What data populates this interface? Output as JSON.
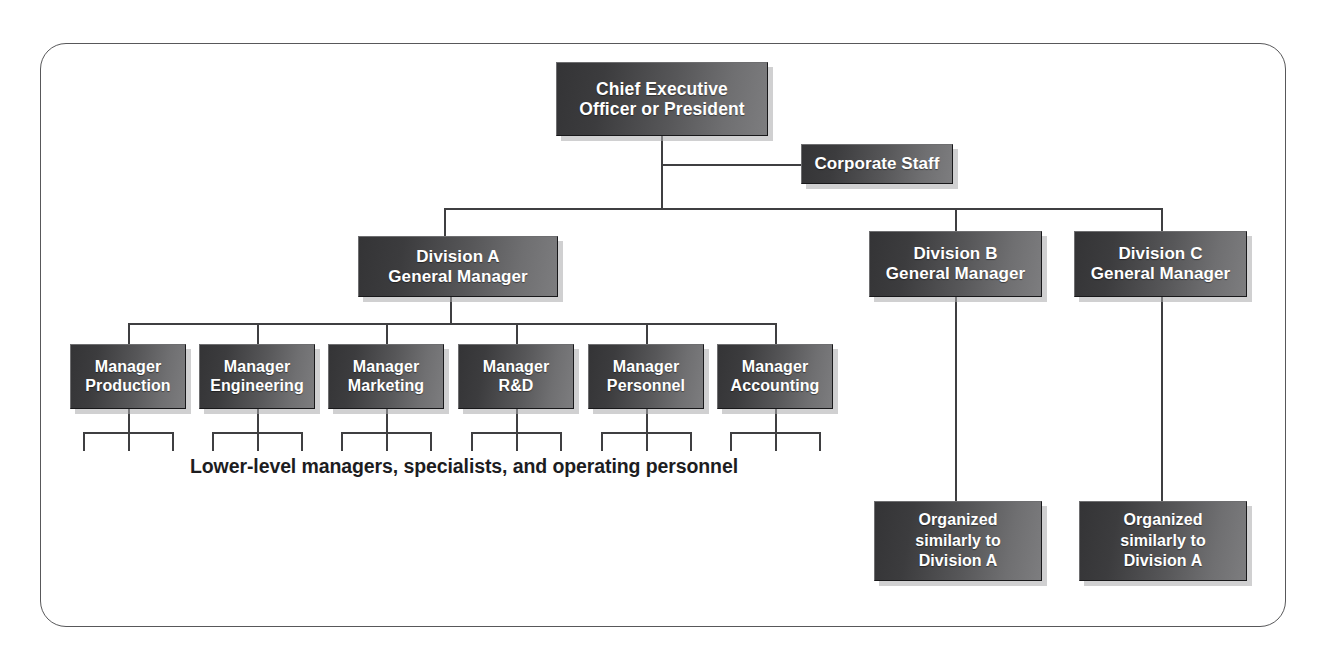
{
  "diagram": {
    "frame": {
      "style": "rounded-rectangle-border",
      "color": "#58585a"
    },
    "colors": {
      "box_gradient_dark": "#343436",
      "box_gradient_light": "#7d7d7f",
      "box_text": "#ffffff",
      "line": "#3f3f41",
      "shadow": "#aaaaac",
      "background": "#ffffff",
      "caption_text": "#1d1d1f"
    },
    "nodes": {
      "ceo": {
        "line1": "Chief Executive",
        "line2": "Officer or President"
      },
      "corporate_staff": {
        "label": "Corporate Staff"
      },
      "division_a": {
        "line1": "Division A",
        "line2": "General Manager"
      },
      "division_b": {
        "line1": "Division B",
        "line2": "General Manager"
      },
      "division_c": {
        "line1": "Division C",
        "line2": "General Manager"
      },
      "managers": [
        {
          "line1": "Manager",
          "line2": "Production"
        },
        {
          "line1": "Manager",
          "line2": "Engineering"
        },
        {
          "line1": "Manager",
          "line2": "Marketing"
        },
        {
          "line1": "Manager",
          "line2": "R&D"
        },
        {
          "line1": "Manager",
          "line2": "Personnel"
        },
        {
          "line1": "Manager",
          "line2": "Accounting"
        }
      ],
      "similar_b": {
        "line1": "Organized",
        "line2": "similarly to",
        "line3": "Division A"
      },
      "similar_c": {
        "line1": "Organized",
        "line2": "similarly to",
        "line3": "Division A"
      }
    },
    "caption": "Lower-level managers, specialists, and operating personnel"
  }
}
